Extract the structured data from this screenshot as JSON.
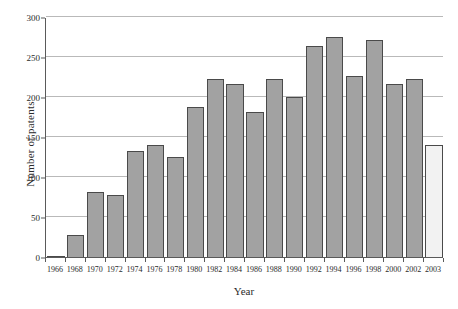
{
  "chart_data": {
    "type": "bar",
    "title": "",
    "xlabel": "Year",
    "ylabel": "Number of patents",
    "categories": [
      "1966",
      "1968",
      "1970",
      "1972",
      "1974",
      "1976",
      "1978",
      "1980",
      "1982",
      "1984",
      "1986",
      "1988",
      "1990",
      "1992",
      "1994",
      "1996",
      "1998",
      "2000",
      "2002",
      "2003"
    ],
    "values": [
      1,
      28,
      81,
      78,
      132,
      140,
      125,
      188,
      222,
      216,
      181,
      222,
      200,
      264,
      275,
      226,
      271,
      216,
      222,
      140
    ],
    "series": [
      {
        "name": "Number of patents",
        "values": [
          1,
          28,
          81,
          78,
          132,
          140,
          125,
          188,
          222,
          216,
          181,
          222,
          200,
          264,
          275,
          226,
          271,
          216,
          222,
          140
        ]
      }
    ],
    "bar_styles": [
      "filled",
      "filled",
      "filled",
      "filled",
      "filled",
      "filled",
      "filled",
      "filled",
      "filled",
      "filled",
      "filled",
      "filled",
      "filled",
      "filled",
      "filled",
      "filled",
      "filled",
      "filled",
      "filled",
      "highlight"
    ],
    "ylim": [
      0,
      300
    ],
    "yticks": [
      0,
      50,
      100,
      150,
      200,
      250,
      300
    ],
    "ytick_labels": [
      "0",
      "50",
      "100",
      "150",
      "200",
      "250",
      "300"
    ],
    "xtick_labels": [
      "1966",
      "1968",
      "1970",
      "1972",
      "1974",
      "1976",
      "1978",
      "1980",
      "1982",
      "1984",
      "1986",
      "1988",
      "1990",
      "1992",
      "1994",
      "1996",
      "1998",
      "2000",
      "2002",
      "2003"
    ],
    "grid": true,
    "grid_axis": "y",
    "legend": false,
    "legend_position": "none",
    "bar_color": "#a2a2a2",
    "highlight_bar_color": "#f2f2f2",
    "bar_edge_color": "#4a4a4a",
    "gridline_color": "#b9b9b9",
    "axis_color": "#5a5a5a",
    "background_color": "#ffffff",
    "text_color": "#2b2b2b"
  }
}
